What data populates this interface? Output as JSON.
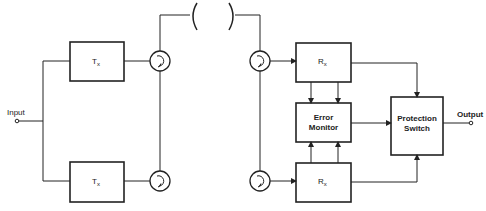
{
  "diagram": {
    "type": "block-diagram",
    "title": "",
    "input": {
      "label": "Input"
    },
    "output": {
      "label": "Output"
    },
    "transmitters": [
      {
        "label": "T",
        "subscript": "x"
      },
      {
        "label": "T",
        "subscript": "x"
      }
    ],
    "receivers": [
      {
        "label": "R",
        "subscript": "x"
      },
      {
        "label": "R",
        "subscript": "x"
      }
    ],
    "error_monitor": {
      "line1": "Error",
      "line2": "Monitor"
    },
    "protection_switch": {
      "line1": "Protection",
      "line2": "Switch"
    },
    "circulators": [
      "circulator-tx-1",
      "circulator-tx-2",
      "circulator-rx-1",
      "circulator-rx-2"
    ],
    "channel": {
      "symbol": "( )"
    },
    "colors": {
      "stroke": "#222222",
      "background": "#ffffff"
    }
  }
}
